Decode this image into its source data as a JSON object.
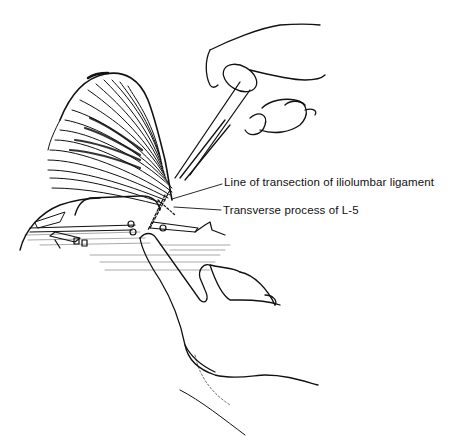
{
  "figure": {
    "type": "surgical line illustration",
    "labels": [
      {
        "text": "Line of transection of iliolumbar ligament"
      },
      {
        "text": "Transverse process of L-5"
      }
    ],
    "colors": {
      "line": "#111111",
      "background": "#ffffff"
    }
  }
}
